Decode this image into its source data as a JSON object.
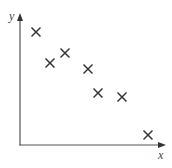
{
  "chart_data": {
    "type": "scatter",
    "title": "",
    "xlabel": "x",
    "ylabel": "y",
    "grid": false,
    "legend": null,
    "marker": "x",
    "axis_color": "#555555",
    "marker_color": "#333333",
    "xlim": [
      0,
      145
    ],
    "ylim": [
      0,
      130
    ],
    "points": [
      {
        "x": 16,
        "y": 113
      },
      {
        "x": 30,
        "y": 82
      },
      {
        "x": 45,
        "y": 92
      },
      {
        "x": 68,
        "y": 76
      },
      {
        "x": 78,
        "y": 52
      },
      {
        "x": 102,
        "y": 48
      },
      {
        "x": 128,
        "y": 10
      }
    ]
  }
}
